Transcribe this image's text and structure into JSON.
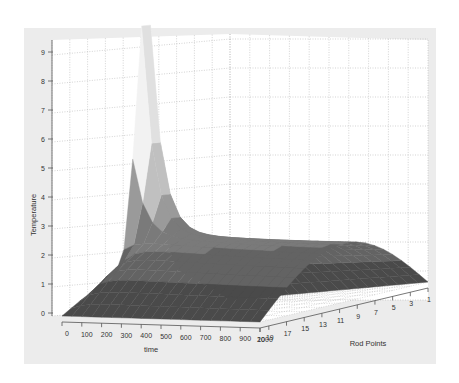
{
  "figure": {
    "background": "#ffffff",
    "frame_color": "#ececec",
    "axes_background": "#ffffff",
    "grid_color": "#b5b5b5",
    "axis_color": "#555555"
  },
  "chart_data": {
    "type": "surface3d",
    "title": "",
    "xlabel": "time",
    "ylabel": "Rod Points",
    "zlabel": "Temperature",
    "x_ticks": [
      "0",
      "100",
      "200",
      "300",
      "400",
      "500",
      "600",
      "700",
      "800",
      "900",
      "1000"
    ],
    "y_ticks": [
      "20",
      "19",
      "17",
      "15",
      "13",
      "11",
      "9",
      "7",
      "5",
      "3",
      "1"
    ],
    "z_ticks": [
      "0",
      "1",
      "2",
      "3",
      "4",
      "5",
      "6",
      "7",
      "8",
      "9"
    ],
    "xlim": [
      0,
      1000
    ],
    "ylim": [
      1,
      20
    ],
    "zlim": [
      0,
      9
    ],
    "grid": true,
    "colormap": "gray",
    "shading": "faceted-flat",
    "peak": {
      "time": 0,
      "rod_point": 10,
      "temperature": 9.2
    },
    "final_profile": {
      "time": 1000,
      "rod_points": [
        1,
        3,
        5,
        7,
        9,
        11,
        13,
        15,
        17,
        19,
        20
      ],
      "temperature": [
        0.0,
        0.9,
        1.7,
        2.3,
        2.6,
        2.6,
        2.3,
        1.7,
        0.9,
        0.2,
        0.0
      ]
    },
    "edge_profile_rod_point_20": {
      "time": [
        0,
        100,
        200,
        300,
        400,
        500,
        600,
        700,
        800,
        900,
        1000
      ],
      "temperature": [
        0.0,
        0.0,
        0.0,
        0.0,
        0.0,
        0.0,
        0.0,
        0.0,
        0.0,
        0.0,
        0.0
      ]
    },
    "color_bands": [
      "#4a4a4a",
      "#636363",
      "#7a7a7a",
      "#9a9a9a",
      "#c0c0c0",
      "#dcdcdc",
      "#f2f2f2",
      "#e0e0e0",
      "#b8b8b8",
      "#8f8f8f"
    ]
  }
}
